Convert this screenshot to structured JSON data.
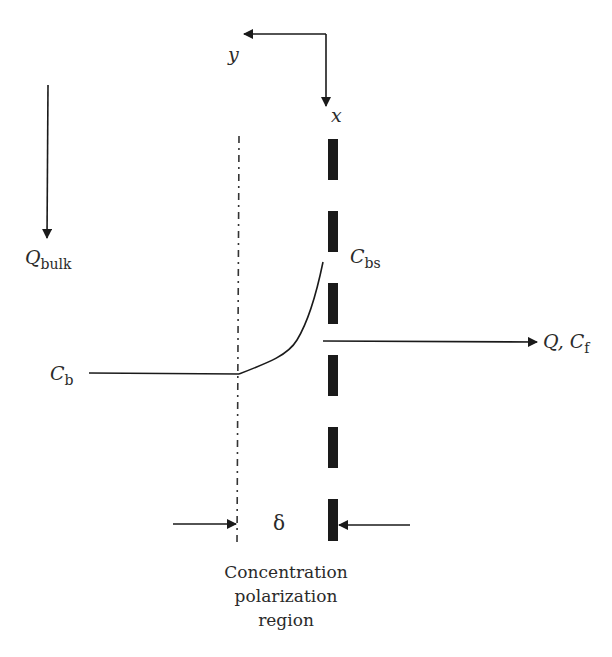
{
  "diagram": {
    "type": "concentration-polarization-schematic",
    "axes": {
      "y_label": "y",
      "x_label": "x"
    },
    "labels": {
      "q_bulk_main": "Q",
      "q_bulk_sub": "bulk",
      "c_b_main": "C",
      "c_b_sub": "b",
      "c_bs_main": "C",
      "c_bs_sub": "bs",
      "q_cf_main": "Q, C",
      "q_cf_sub": "f",
      "delta": "δ"
    },
    "caption": {
      "line1": "Concentration",
      "line2": "polarization",
      "line3": "region"
    },
    "elements": {
      "boundary_layer_edge": "dash-dot vertical line",
      "membrane": "thick dashed vertical line",
      "profile_curve": "concentration rising from Cb to Cbs",
      "permeate_arrow": "arrow to Q, Cf",
      "bulk_flow_arrow": "downward arrow Qbulk"
    },
    "colors": {
      "ink": "#1a1a1a",
      "background": "#ffffff"
    }
  }
}
